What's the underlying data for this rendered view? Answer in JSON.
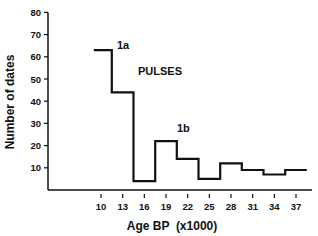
{
  "chart_data": {
    "type": "line",
    "style": "step",
    "title": "",
    "xlabel": "Age BP (x1000)",
    "ylabel": "Number of dates",
    "ylim": [
      0,
      80
    ],
    "yticks": [
      10,
      20,
      30,
      40,
      50,
      60,
      70,
      80
    ],
    "xticks": [
      10,
      13,
      16,
      19,
      22,
      25,
      28,
      31,
      34,
      37
    ],
    "grid": false,
    "legend": null,
    "annotations": [
      {
        "text": "1a",
        "x": 11.5,
        "y": 66
      },
      {
        "text": "PULSES",
        "x": 13.5,
        "y": 53
      },
      {
        "text": "1b",
        "x": 21,
        "y": 25
      }
    ],
    "x": [
      9,
      11.5,
      14.5,
      17.5,
      20.5,
      23.5,
      26.5,
      29.5,
      32.5,
      35.5
    ],
    "bin_edges": [
      9,
      11.5,
      14.5,
      17.5,
      20.5,
      23.5,
      26.5,
      29.5,
      32.5,
      35.5,
      38.5
    ],
    "values": [
      63,
      44,
      4,
      22,
      14,
      5,
      12,
      9,
      7,
      9
    ]
  },
  "labels": {
    "ylabel": "Number of dates",
    "xlabel": "Age BP  (x1000)",
    "a1": "1a",
    "pulses": "PULSES",
    "b1": "1b"
  }
}
